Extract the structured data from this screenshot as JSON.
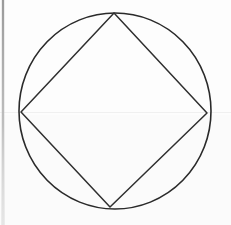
{
  "figure": {
    "canvas": {
      "width": 231,
      "height": 225,
      "background_color": "#fdfdfd"
    },
    "ink_color": "#2a2a2a",
    "stroke_width": 1.6,
    "shapes": {
      "circle": {
        "name": "circumscribed-circle",
        "center_x": 115,
        "center_y": 111,
        "radius_x": 96,
        "radius_y": 98,
        "stroke_color": "#2a2a2a"
      },
      "square": {
        "name": "inscribed-square",
        "vertex_count": 4,
        "stroke_color": "#2f2f2f",
        "vertices": [
          {
            "label": "top",
            "x": 114,
            "y": 13
          },
          {
            "label": "right",
            "x": 207,
            "y": 113
          },
          {
            "label": "bottom",
            "x": 110,
            "y": 207
          },
          {
            "label": "left",
            "x": 21,
            "y": 112
          }
        ],
        "points_path": "114,13 207,113 110,207 21,112"
      }
    },
    "artifacts": {
      "left_scan_strip": {
        "name": "scan-edge-strip",
        "x": 2,
        "width": 2,
        "color": "#a8a8a8"
      },
      "horizontal_hairline": {
        "name": "scan-hairline",
        "y": 112,
        "color": "#f0f0f0"
      },
      "tone_band": {
        "name": "paper-tone-band",
        "y": 115,
        "color": "#fbfbfb"
      }
    }
  }
}
